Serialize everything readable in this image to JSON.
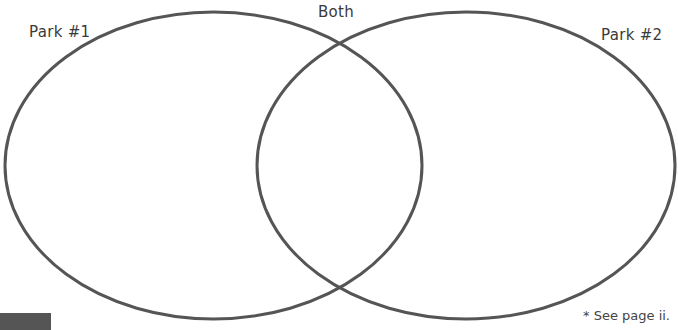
{
  "diagram": {
    "type": "venn",
    "sets": [
      {
        "id": "left",
        "label": "Park #1",
        "cx": 213.5,
        "cy": 165.5,
        "rx": 208.5,
        "ry": 153.5
      },
      {
        "id": "right",
        "label": "Park #2",
        "cx": 466,
        "cy": 165.5,
        "rx": 209,
        "ry": 153.5
      }
    ],
    "intersection_label": "Both",
    "stroke_color": "#555555",
    "stroke_width": 3
  },
  "labels": {
    "left": "Park #1",
    "both": "Both",
    "right": "Park #2"
  },
  "footnote": "* See page ii."
}
